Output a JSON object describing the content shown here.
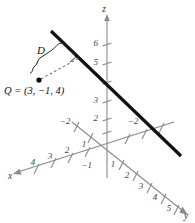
{
  "figure": {
    "kind": "3d-coordinate-diagram",
    "background_color": "#ffffff",
    "axis_color": "#8a8a8a",
    "line_color": "#111111",
    "dash_color": "#777777"
  },
  "labels": {
    "point_label": "Q = (3, −1, 4)",
    "distance_label": "D",
    "axis_x": "x",
    "axis_y": "y",
    "axis_z": "z"
  },
  "axes": {
    "x": {
      "name": "x",
      "positive_ticks": [
        "1",
        "2",
        "3",
        "4"
      ],
      "negative_ticks": [
        "−2"
      ]
    },
    "y": {
      "name": "y",
      "positive_ticks": [
        "1",
        "2",
        "3",
        "4",
        "5"
      ],
      "negative_ticks": [
        "−2"
      ]
    },
    "z": {
      "name": "z",
      "positive_ticks": [
        "2",
        "3",
        "5",
        "6"
      ],
      "hidden_ticks": [
        "1",
        "4"
      ]
    }
  },
  "ticks": {
    "z": [
      {
        "label": "6",
        "x": 98,
        "y": 43
      },
      {
        "label": "5",
        "x": 98,
        "y": 62
      },
      {
        "label": "3",
        "x": 98,
        "y": 100
      },
      {
        "label": "2",
        "x": 98,
        "y": 118
      }
    ],
    "x_positive": [
      {
        "label": "1",
        "x": 80,
        "y": 146
      },
      {
        "label": "2",
        "x": 64,
        "y": 151
      },
      {
        "label": "3",
        "x": 46,
        "y": 157
      },
      {
        "label": "4",
        "x": 29,
        "y": 163
      }
    ],
    "x_negative": [
      {
        "label": "−2",
        "x": 129,
        "y": 124
      }
    ],
    "y_positive": [
      {
        "label": "1",
        "x": 110,
        "y": 165
      },
      {
        "label": "2",
        "x": 124,
        "y": 175
      },
      {
        "label": "3",
        "x": 138,
        "y": 187
      },
      {
        "label": "4",
        "x": 153,
        "y": 198
      },
      {
        "label": "5",
        "x": 167,
        "y": 209
      }
    ],
    "y_negative": [
      {
        "label": "−2",
        "x": 61,
        "y": 124
      }
    ],
    "near_origin": [
      {
        "label": "−1",
        "x": 88,
        "y": 165
      }
    ]
  },
  "geometry": {
    "origin": {
      "x": 107,
      "y": 145
    },
    "q_point": {
      "x": 39,
      "y": 80
    },
    "line_start": {
      "x": 51,
      "y": 31
    },
    "line_end": {
      "x": 181,
      "y": 156
    },
    "foot_of_perpendicular": {
      "x": 77,
      "y": 56
    }
  }
}
